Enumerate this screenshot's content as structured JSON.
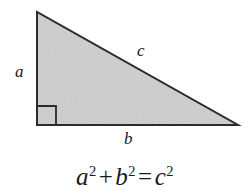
{
  "figure": {
    "background_color": "#ffffff",
    "stroke_color": "#2b2b2b",
    "fill_color": "#d3d3d3",
    "text_color": "#1a1a1a"
  },
  "triangle": {
    "shape": "right-triangle",
    "vertices": {
      "apex": [
        37,
        12
      ],
      "bottom_left": [
        37,
        125
      ],
      "bottom_right": [
        238,
        125
      ]
    },
    "right_angle_vertex": "bottom_left",
    "right_angle_marker_size": 19,
    "stroke_width": 2
  },
  "labels": {
    "leg_vertical": "a",
    "hypotenuse": "c",
    "leg_horizontal": "b"
  },
  "equation": {
    "base_a": "a",
    "exp_a": "2",
    "plus": "+",
    "base_b": "b",
    "exp_b": "2",
    "equals": "=",
    "base_c": "c",
    "exp_c": "2",
    "plain_text": "a2 + b2 = c2"
  }
}
